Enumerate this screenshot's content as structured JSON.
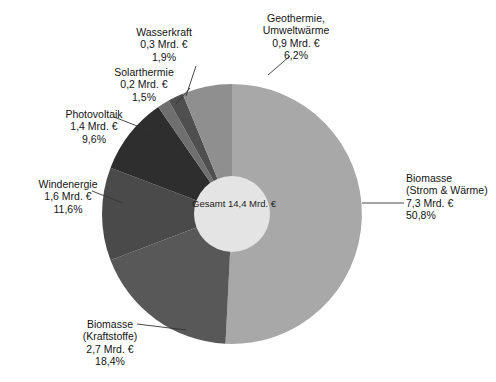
{
  "chart_data": {
    "type": "pie",
    "title": "",
    "subtitle": "",
    "center_label": {
      "line1": "Gesamt",
      "line2": "14,4 Mrd. €"
    },
    "total_value": 14.4,
    "unit": "Mrd. €",
    "donut_hole": true,
    "legend_position": "callout-labels",
    "grid": false,
    "start_angle_deg": 0,
    "direction": "clockwise",
    "categories": [
      "Biomasse (Strom & Wärme)",
      "Biomasse (Kraftstoffe)",
      "Windenergie",
      "Photovoltaik",
      "Solarthermie",
      "Wasserkraft",
      "Geothermie, Umweltwärme"
    ],
    "values": [
      7.3,
      2.7,
      1.6,
      1.4,
      0.2,
      0.3,
      0.9
    ],
    "percents": [
      50.8,
      18.4,
      11.6,
      9.6,
      1.5,
      1.9,
      6.2
    ],
    "colors": [
      "#a8a8a8",
      "#585858",
      "#4a4a4a",
      "#2e2e2e",
      "#6f6f6f",
      "#4f4f4f",
      "#8f8f8f"
    ],
    "slices": [
      {
        "key": "biomasse-strom-waerme",
        "name_line1": "Biomasse",
        "name_line2": "(Strom & Wärme)",
        "value_label": "7,3 Mrd. €",
        "percent_label": "50,8%",
        "value": 7.3,
        "percent": 50.8,
        "color": "#a8a8a8"
      },
      {
        "key": "biomasse-kraftstoffe",
        "name_line1": "Biomasse",
        "name_line2": "(Kraftstoffe)",
        "value_label": "2,7 Mrd. €",
        "percent_label": "18,4%",
        "value": 2.7,
        "percent": 18.4,
        "color": "#585858"
      },
      {
        "key": "windenergie",
        "name_line1": "Windenergie",
        "name_line2": "",
        "value_label": "1,6 Mrd. €",
        "percent_label": "11,6%",
        "value": 1.6,
        "percent": 11.6,
        "color": "#4a4a4a"
      },
      {
        "key": "photovoltaik",
        "name_line1": "Photovoltaik",
        "name_line2": "",
        "value_label": "1,4 Mrd. €",
        "percent_label": "9,6%",
        "value": 1.4,
        "percent": 9.6,
        "color": "#2e2e2e"
      },
      {
        "key": "solarthermie",
        "name_line1": "Solarthermie",
        "name_line2": "",
        "value_label": "0,2 Mrd. €",
        "percent_label": "1,5%",
        "value": 0.2,
        "percent": 1.5,
        "color": "#6f6f6f"
      },
      {
        "key": "wasserkraft",
        "name_line1": "Wasserkraft",
        "name_line2": "",
        "value_label": "0,3 Mrd. €",
        "percent_label": "1,9%",
        "value": 0.3,
        "percent": 1.9,
        "color": "#4f4f4f"
      },
      {
        "key": "geothermie-umweltwaerme",
        "name_line1": "Geothermie,",
        "name_line2": "Umweltwärme",
        "value_label": "0,9 Mrd. €",
        "percent_label": "6,2%",
        "value": 0.9,
        "percent": 6.2,
        "color": "#8f8f8f"
      }
    ]
  }
}
